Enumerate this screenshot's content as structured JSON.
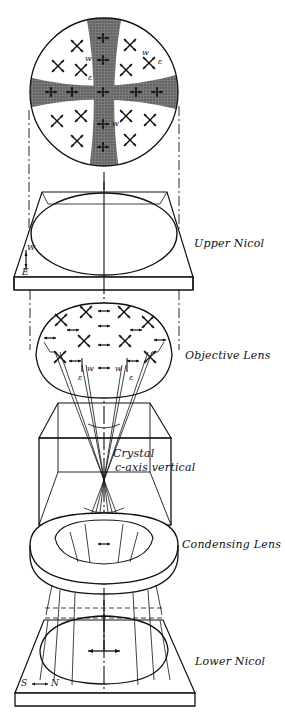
{
  "figure": {
    "type": "polarizing microscope conoscopic illumination diagram",
    "components": [
      {
        "id": "interference_figure",
        "label": ""
      },
      {
        "id": "upper_nicol",
        "label": "Upper Nicol"
      },
      {
        "id": "objective_lens",
        "label": "Objective Lens"
      },
      {
        "id": "crystal",
        "label": "Crystal",
        "sublabel": "c-axis vertical"
      },
      {
        "id": "condensing_lens",
        "label": "Condensing Lens"
      },
      {
        "id": "lower_nicol",
        "label": "Lower Nicol"
      }
    ],
    "annotations": {
      "figure_w1": "w",
      "figure_e1": "ε",
      "figure_w2": "w",
      "figure_e2": "ε",
      "figure_w3": "w",
      "upper_nicol_w": "W",
      "upper_nicol_e": "E",
      "objective_w_left": "w",
      "objective_e_left": "ε",
      "objective_w_right": "w",
      "objective_e_right": "ε",
      "lower_nicol_s": "S",
      "lower_nicol_n": "N",
      "lower_nicol_arrow": "↔"
    },
    "colors": {
      "ink": "#111111",
      "isogyre": "#555555",
      "background": "#ffffff"
    }
  }
}
